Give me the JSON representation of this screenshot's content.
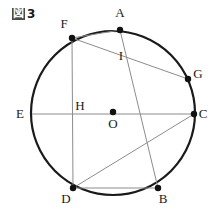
{
  "caption": {
    "kanji": "図",
    "number": "3"
  },
  "figure": {
    "type": "circle-geometry-diagram",
    "colors": {
      "circle_stroke": "#1a1a1a",
      "chord_stroke": "#8c8c8c",
      "point_fill": "#111111",
      "label_color": "#1a1a1a",
      "background": "#ffffff"
    },
    "circle": {
      "center_label": "O",
      "cx": 113,
      "cy": 113,
      "r": 82
    },
    "points": [
      {
        "label": "A",
        "x": 120,
        "y": 30,
        "on_circle": true,
        "marked": true,
        "label_x": 120,
        "label_y": 17
      },
      {
        "label": "F",
        "x": 72,
        "y": 38,
        "on_circle": true,
        "marked": true,
        "label_x": 64,
        "label_y": 28
      },
      {
        "label": "G",
        "x": 188,
        "y": 79,
        "on_circle": true,
        "marked": true,
        "label_x": 198,
        "label_y": 78
      },
      {
        "label": "C",
        "x": 194,
        "y": 114,
        "on_circle": true,
        "marked": true,
        "label_x": 203,
        "label_y": 118
      },
      {
        "label": "E",
        "x": 32,
        "y": 114,
        "on_circle": true,
        "marked": false,
        "label_x": 20,
        "label_y": 118
      },
      {
        "label": "D",
        "x": 73,
        "y": 188,
        "on_circle": true,
        "marked": true,
        "label_x": 66,
        "label_y": 203
      },
      {
        "label": "B",
        "x": 158,
        "y": 188,
        "on_circle": true,
        "marked": true,
        "label_x": 163,
        "label_y": 203
      },
      {
        "label": "O",
        "x": 113,
        "y": 112,
        "on_circle": false,
        "marked": true,
        "label_x": 113,
        "label_y": 128
      },
      {
        "label": "H",
        "x": 73,
        "y": 114,
        "on_circle": false,
        "marked": false,
        "label_x": 80,
        "label_y": 110
      },
      {
        "label": "I",
        "x": 124,
        "y": 62,
        "on_circle": false,
        "marked": false,
        "label_x": 121,
        "label_y": 60
      }
    ],
    "segments": [
      {
        "name": "chord-E-C",
        "from": "E",
        "to": "C",
        "x1": 32,
        "y1": 114,
        "x2": 194,
        "y2": 114
      },
      {
        "name": "chord-F-D",
        "from": "F",
        "to": "D",
        "x1": 72,
        "y1": 38,
        "x2": 73,
        "y2": 188
      },
      {
        "name": "chord-F-A",
        "from": "F",
        "to": "A",
        "x1": 72,
        "y1": 38,
        "x2": 120,
        "y2": 30
      },
      {
        "name": "chord-F-G",
        "from": "F",
        "to": "G",
        "x1": 72,
        "y1": 38,
        "x2": 188,
        "y2": 79
      },
      {
        "name": "chord-A-B",
        "from": "A",
        "to": "B",
        "x1": 120,
        "y1": 30,
        "x2": 158,
        "y2": 188
      },
      {
        "name": "chord-D-C",
        "from": "D",
        "to": "C",
        "x1": 73,
        "y1": 188,
        "x2": 194,
        "y2": 114
      },
      {
        "name": "chord-D-B",
        "from": "D",
        "to": "B",
        "x1": 73,
        "y1": 188,
        "x2": 158,
        "y2": 188
      }
    ]
  }
}
